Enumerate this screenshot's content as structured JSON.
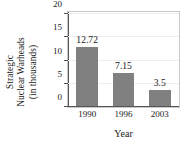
{
  "chart_data": {
    "type": "bar",
    "title": "",
    "xlabel": "Year",
    "ylabel": "Strategic Nuclear Warheads (in thousands)",
    "ylabel_lines": [
      "Strategic",
      "Nuclear Warheads",
      "(in thousands)"
    ],
    "categories": [
      "1990",
      "1996",
      "2003"
    ],
    "values": [
      12.72,
      7.15,
      3.5
    ],
    "value_labels": [
      "12.72",
      "7.15",
      "3.5"
    ],
    "ylim": [
      0,
      20
    ],
    "yticks": [
      0,
      5,
      10,
      15,
      20
    ],
    "ytick_labels": [
      "0",
      "5",
      "10",
      "15",
      "20"
    ],
    "grid": true,
    "legend": "none",
    "bar_color": "#808080",
    "axis_color": "#555555",
    "grid_color": "#ededed",
    "frame_color": "#c9c9c9",
    "text_color": "#1a1a1a"
  }
}
